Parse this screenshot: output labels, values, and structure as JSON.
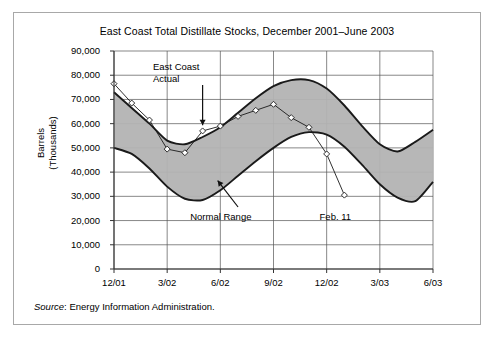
{
  "figure": {
    "title": "East Coast Total Distillate Stocks, December 2001–June 2003",
    "source_label": "Source",
    "source_colon": ":",
    "source_text": " Energy Information Administration.",
    "border_color": "#a8a8a8"
  },
  "annotations": {
    "actual": "East Coast\nActual",
    "normal_range": "Normal Range",
    "feb": "Feb. 11"
  },
  "chart_data": {
    "type": "area",
    "title": "East Coast Total Distillate Stocks, December 2001–June 2003",
    "xlabel": "",
    "ylabel": "Barrels\n(Thousands)",
    "grid": true,
    "legend_position": "none",
    "ylim": [
      0,
      90000
    ],
    "yticks": [
      "0",
      "10,000",
      "20,000",
      "30,000",
      "40,000",
      "50,000",
      "60,000",
      "70,000",
      "80,000",
      "90,000"
    ],
    "ytick_values": [
      0,
      10000,
      20000,
      30000,
      40000,
      50000,
      60000,
      70000,
      80000,
      90000
    ],
    "xticks": [
      "12/01",
      "3/02",
      "6/02",
      "9/02",
      "12/02",
      "3/03",
      "6/03"
    ],
    "xtick_months": [
      0,
      3,
      6,
      9,
      12,
      15,
      18
    ],
    "xlim_months": [
      0,
      18
    ],
    "band_color": "#b3b3b3",
    "line_color": "#1a1a1a",
    "series": [
      {
        "name": "Normal Range Upper",
        "type": "band-upper",
        "x": [
          0,
          1,
          2,
          3,
          4,
          5,
          6,
          7,
          8,
          9,
          10,
          11,
          12,
          13,
          14,
          15,
          16,
          17,
          18
        ],
        "values": [
          73000,
          66500,
          60000,
          53000,
          51500,
          54500,
          58500,
          64500,
          70500,
          75500,
          78000,
          78000,
          74500,
          67500,
          59000,
          51500,
          48500,
          52500,
          57500
        ]
      },
      {
        "name": "Normal Range Lower",
        "type": "band-lower",
        "x": [
          0,
          1,
          2,
          3,
          4,
          5,
          6,
          7,
          8,
          9,
          10,
          11,
          12,
          13,
          14,
          15,
          16,
          17,
          18
        ],
        "values": [
          50000,
          47500,
          41500,
          34000,
          29000,
          28500,
          32500,
          38500,
          44500,
          50000,
          54500,
          56500,
          55500,
          50500,
          43000,
          35000,
          29500,
          28000,
          36000
        ]
      },
      {
        "name": "East Coast Actual",
        "type": "line-markers",
        "marker": "diamond",
        "x": [
          0,
          1,
          2,
          3,
          4,
          5,
          6,
          7,
          8,
          9,
          10,
          11,
          12,
          13
        ],
        "values": [
          76500,
          68500,
          61500,
          49500,
          48000,
          57000,
          59000,
          63000,
          65500,
          68000,
          62500,
          58500,
          47500,
          30500
        ],
        "labels": [
          "12/01",
          "1/02",
          "2/02",
          "3/02",
          "4/02",
          "5/02",
          "6/02",
          "7/02",
          "8/02",
          "9/02",
          "10/02",
          "11/02",
          "12/02",
          "1/03"
        ]
      }
    ]
  }
}
